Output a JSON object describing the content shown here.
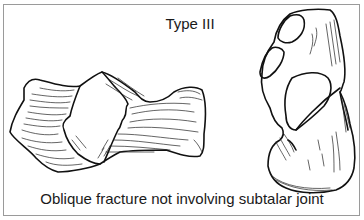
{
  "figure": {
    "title": "Type III",
    "caption": "Oblique fracture not involving subtalar joint",
    "illustrations": [
      {
        "name": "calcaneus-lateral-view",
        "description": "Lateral view of calcaneus with oblique fracture line"
      },
      {
        "name": "calcaneus-superior-view",
        "description": "Superior view of calcaneus with fracture line"
      }
    ],
    "colors": {
      "ink": "#111111",
      "frame": "#9a9a9a",
      "background": "#ffffff"
    }
  }
}
